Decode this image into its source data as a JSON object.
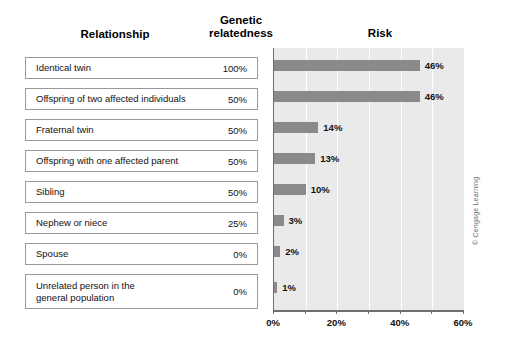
{
  "figure": {
    "headers": {
      "relationship": "Relationship",
      "relatedness_line1": "Genetic",
      "relatedness_line2": "relatedness",
      "risk": "Risk"
    },
    "rows": [
      {
        "label": "Identical twin",
        "relatedness": "100%"
      },
      {
        "label": "Offspring of two affected individuals",
        "relatedness": "50%"
      },
      {
        "label": "Fraternal twin",
        "relatedness": "50%"
      },
      {
        "label": "Offspring with one affected parent",
        "relatedness": "50%"
      },
      {
        "label": "Sibling",
        "relatedness": "50%"
      },
      {
        "label": "Nephew or niece",
        "relatedness": "25%"
      },
      {
        "label": "Spouse",
        "relatedness": "0%"
      },
      {
        "label": "Unrelated person in the\ngeneral population",
        "relatedness": "0%"
      }
    ],
    "credit": "© Cengage Learning",
    "colors": {
      "bar": "#8a8a8a",
      "plot_background": "#eaeaea",
      "gridline": "#ffffff",
      "axis": "#6f6f6f",
      "row_border": "#9a9a9a"
    }
  },
  "chart_data": {
    "type": "bar",
    "orientation": "horizontal",
    "title": "Risk",
    "xlabel": "",
    "ylabel": "",
    "categories": [
      "Identical twin",
      "Offspring of two affected individuals",
      "Fraternal twin",
      "Offspring with one affected parent",
      "Sibling",
      "Nephew or niece",
      "Spouse",
      "Unrelated person in the general population"
    ],
    "values": [
      46,
      46,
      14,
      13,
      10,
      3,
      2,
      1
    ],
    "data_labels": [
      "46%",
      "46%",
      "14%",
      "13%",
      "10%",
      "3%",
      "2%",
      "1%"
    ],
    "xlim": [
      0,
      60
    ],
    "xticks": [
      0,
      10,
      20,
      30,
      40,
      50,
      60
    ],
    "xtick_labels": [
      "0%",
      "",
      "20%",
      "",
      "40%",
      "",
      "60%"
    ],
    "grid": true,
    "legend": false
  }
}
